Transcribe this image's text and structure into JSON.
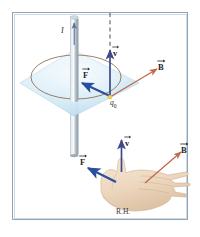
{
  "figure": {
    "frame_color": "#8fa6b8",
    "background": "#ffffff"
  },
  "top_panel": {
    "name": "current-wire-and-field-circle",
    "wire": {
      "label": "I",
      "label_meaning": "current",
      "color": "#9aa8b4",
      "direction": "upward"
    },
    "plane": {
      "name": "horizontal-plane",
      "color": "#cfe5f2"
    },
    "field_circle": {
      "name": "magnetic-field-line-circle",
      "color": "#8a6a4a"
    },
    "charge": {
      "label": "q",
      "subscript": "0",
      "dot_color": "#f2d44a"
    },
    "vectors": [
      {
        "key": "v",
        "label": "v",
        "meaning": "velocity",
        "color": "#3c4a8c",
        "direction": "up"
      },
      {
        "key": "B",
        "label": "B",
        "meaning": "magnetic-field",
        "color": "#c06a4a",
        "direction": "up-right"
      },
      {
        "key": "F",
        "label": "F",
        "meaning": "force",
        "color": "#2b4f9e",
        "direction": "down-left"
      }
    ],
    "dashed_line": {
      "name": "dashed-vertical-guide",
      "color": "#5a5a66"
    }
  },
  "bottom_panel": {
    "name": "right-hand-rule",
    "hand_label": "R.H.",
    "hand_color": "#ecd6bd",
    "vectors": [
      {
        "key": "v",
        "label": "v",
        "meaning": "velocity-thumb",
        "color": "#3c4a8c",
        "direction": "up"
      },
      {
        "key": "B",
        "label": "B",
        "meaning": "magnetic-field-fingers",
        "color": "#c06a4a",
        "direction": "up-right"
      },
      {
        "key": "F",
        "label": "F",
        "meaning": "force-palm",
        "color": "#2b4f9e",
        "direction": "up-left"
      }
    ]
  }
}
